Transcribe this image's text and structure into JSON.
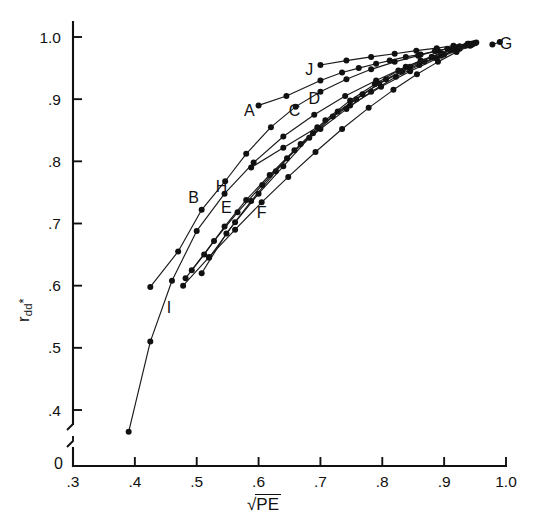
{
  "figure": {
    "background": "#ffffff",
    "ink_color": "#111111",
    "width": 533,
    "height": 532
  },
  "axes": {
    "x_title": "√PE",
    "x_title_radical": "√",
    "x_title_radicand": "PE",
    "y_title": "r_dd*",
    "y_title_base": "r",
    "y_title_sub": "dd",
    "y_title_sup": "*",
    "origin_label": "0",
    "x_ticks": [
      ".3",
      ".4",
      ".5",
      ".6",
      ".7",
      ".8",
      ".9",
      "1.0"
    ],
    "x_tick_values": [
      0.3,
      0.4,
      0.5,
      0.6,
      0.7,
      0.8,
      0.9,
      1.0
    ],
    "y_ticks": [
      ".4",
      ".5",
      ".6",
      ".7",
      ".8",
      ".9",
      "1.0"
    ],
    "y_tick_values": [
      0.4,
      0.5,
      0.6,
      0.7,
      0.8,
      0.9,
      1.0
    ],
    "axis_break": true,
    "grid": false
  },
  "chart_data": {
    "type": "line",
    "title": "",
    "xlabel": "√PE",
    "ylabel": "r_dd*",
    "xlim": [
      0.3,
      1.0
    ],
    "ylim": [
      0.37,
      1.01
    ],
    "grid": false,
    "legend": "inline-labels",
    "markers": "filled-circle",
    "series": [
      {
        "name": "A",
        "label": "A",
        "label_x": 0.585,
        "label_y": 0.883,
        "x": [
          0.6,
          0.645,
          0.7,
          0.735,
          0.762,
          0.79,
          0.812,
          0.838,
          0.862,
          0.885,
          0.905,
          0.925,
          0.938,
          0.948
        ],
        "y": [
          0.89,
          0.905,
          0.93,
          0.943,
          0.95,
          0.957,
          0.962,
          0.968,
          0.972,
          0.977,
          0.981,
          0.985,
          0.988,
          0.99
        ]
      },
      {
        "name": "B",
        "label": "B",
        "label_x": 0.495,
        "label_y": 0.742,
        "x": [
          0.425,
          0.47,
          0.508,
          0.546,
          0.58,
          0.62,
          0.66,
          0.7,
          0.742,
          0.782,
          0.82,
          0.858,
          0.89,
          0.918,
          0.94
        ],
        "y": [
          0.598,
          0.655,
          0.722,
          0.768,
          0.812,
          0.855,
          0.888,
          0.912,
          0.932,
          0.948,
          0.96,
          0.97,
          0.978,
          0.984,
          0.989
        ]
      },
      {
        "name": "C",
        "label": "C",
        "label_x": 0.658,
        "label_y": 0.882,
        "x": [
          0.52,
          0.562,
          0.6,
          0.64,
          0.682,
          0.72,
          0.758,
          0.795,
          0.832,
          0.868,
          0.9,
          0.925,
          0.945
        ],
        "y": [
          0.645,
          0.702,
          0.748,
          0.792,
          0.838,
          0.872,
          0.9,
          0.925,
          0.944,
          0.96,
          0.972,
          0.981,
          0.988
        ]
      },
      {
        "name": "D",
        "label": "D",
        "label_x": 0.69,
        "label_y": 0.902,
        "x": [
          0.508,
          0.548,
          0.588,
          0.628,
          0.668,
          0.708,
          0.748,
          0.788,
          0.826,
          0.862,
          0.896,
          0.922,
          0.944
        ],
        "y": [
          0.62,
          0.684,
          0.736,
          0.784,
          0.828,
          0.866,
          0.898,
          0.924,
          0.946,
          0.962,
          0.974,
          0.982,
          0.989
        ]
      },
      {
        "name": "E",
        "label": "E",
        "label_x": 0.548,
        "label_y": 0.726,
        "x": [
          0.482,
          0.512,
          0.545,
          0.58,
          0.618,
          0.658,
          0.7,
          0.742,
          0.782,
          0.822,
          0.86,
          0.895,
          0.922,
          0.944
        ],
        "y": [
          0.612,
          0.65,
          0.695,
          0.738,
          0.778,
          0.818,
          0.852,
          0.884,
          0.912,
          0.936,
          0.955,
          0.97,
          0.98,
          0.988
        ]
      },
      {
        "name": "F",
        "label": "F",
        "label_x": 0.605,
        "label_y": 0.718,
        "x": [
          0.478,
          0.52,
          0.562,
          0.605,
          0.648,
          0.692,
          0.735,
          0.778,
          0.818,
          0.856,
          0.89,
          0.92,
          0.942
        ],
        "y": [
          0.6,
          0.646,
          0.69,
          0.734,
          0.775,
          0.815,
          0.852,
          0.886,
          0.915,
          0.94,
          0.96,
          0.976,
          0.986
        ]
      },
      {
        "name": "G",
        "label": "G",
        "label_x": 1.0,
        "label_y": 0.99,
        "x": [
          0.978,
          0.99
        ],
        "y": [
          0.988,
          0.992
        ]
      },
      {
        "name": "H",
        "label": "H",
        "label_x": 0.54,
        "label_y": 0.76,
        "x": [
          0.492,
          0.528,
          0.566,
          0.606,
          0.646,
          0.688,
          0.728,
          0.768,
          0.806,
          0.845,
          0.88,
          0.91,
          0.935,
          0.95
        ],
        "y": [
          0.625,
          0.672,
          0.718,
          0.762,
          0.805,
          0.845,
          0.88,
          0.908,
          0.932,
          0.952,
          0.968,
          0.979,
          0.986,
          0.99
        ]
      },
      {
        "name": "I",
        "label": "I",
        "label_x": 0.455,
        "label_y": 0.565,
        "x": [
          0.39,
          0.425,
          0.46,
          0.5,
          0.545,
          0.592,
          0.64,
          0.69,
          0.74,
          0.79,
          0.838,
          0.88,
          0.915,
          0.942
        ],
        "y": [
          0.365,
          0.51,
          0.608,
          0.688,
          0.748,
          0.798,
          0.84,
          0.875,
          0.905,
          0.93,
          0.952,
          0.968,
          0.98,
          0.988
        ]
      },
      {
        "name": "J",
        "label": "J",
        "label_x": 0.682,
        "label_y": 0.948,
        "x": [
          0.7,
          0.742,
          0.782,
          0.82,
          0.855,
          0.888,
          0.915,
          0.938,
          0.952
        ],
        "y": [
          0.955,
          0.962,
          0.968,
          0.973,
          0.978,
          0.982,
          0.986,
          0.989,
          0.991
        ]
      },
      {
        "name": "K",
        "label": "",
        "label_x": null,
        "label_y": null,
        "x": [
          0.588,
          0.64,
          0.695,
          0.748,
          0.798,
          0.845,
          0.888,
          0.92,
          0.945
        ],
        "y": [
          0.79,
          0.822,
          0.855,
          0.89,
          0.92,
          0.945,
          0.965,
          0.978,
          0.988
        ]
      }
    ]
  }
}
